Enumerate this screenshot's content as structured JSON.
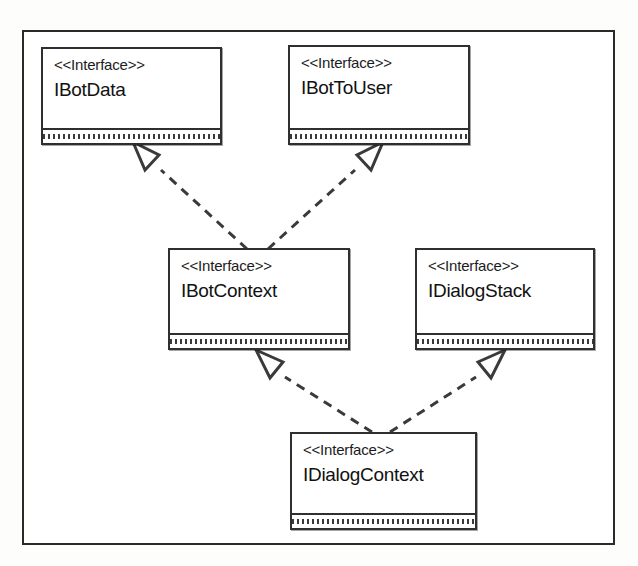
{
  "diagram": {
    "type": "uml-class-diagram",
    "title": "",
    "frame": {
      "border_color": "#2a2a2a",
      "background": "#ffffff"
    },
    "stereotype_label": "<<Interface>>",
    "classes": [
      {
        "id": "ibotdata",
        "stereotype": "<<Interface>>",
        "name": "IBotData",
        "x": 41,
        "y": 47,
        "width": 181,
        "height": 98
      },
      {
        "id": "ibottouser",
        "stereotype": "<<Interface>>",
        "name": "IBotToUser",
        "x": 288,
        "y": 45,
        "width": 182,
        "height": 100
      },
      {
        "id": "ibotcontext",
        "stereotype": "<<Interface>>",
        "name": "IBotContext",
        "x": 168,
        "y": 248,
        "width": 182,
        "height": 102
      },
      {
        "id": "idialogstack",
        "stereotype": "<<Interface>>",
        "name": "IDialogStack",
        "x": 415,
        "y": 248,
        "width": 180,
        "height": 102
      },
      {
        "id": "idialogcontext",
        "stereotype": "<<Interface>>",
        "name": "IDialogContext",
        "x": 290,
        "y": 432,
        "width": 187,
        "height": 98
      }
    ],
    "relationships": [
      {
        "id": "rel-ibotcontext-ibotdata",
        "kind": "realization",
        "line_style": "dashed",
        "arrowhead": "hollow-triangle",
        "from": "IBotContext",
        "to": "IBotData"
      },
      {
        "id": "rel-ibotcontext-ibottouser",
        "kind": "realization",
        "line_style": "dashed",
        "arrowhead": "hollow-triangle",
        "from": "IBotContext",
        "to": "IBotToUser"
      },
      {
        "id": "rel-idialogcontext-ibotcontext",
        "kind": "realization",
        "line_style": "dashed",
        "arrowhead": "hollow-triangle",
        "from": "IDialogContext",
        "to": "IBotContext"
      },
      {
        "id": "rel-idialogcontext-idialogstack",
        "kind": "realization",
        "line_style": "dashed",
        "arrowhead": "hollow-triangle",
        "from": "IDialogContext",
        "to": "IDialogStack"
      }
    ],
    "colors": {
      "line": "#3a3a3a",
      "box_border": "#2f2f2f",
      "text": "#111111",
      "background": "#ffffff"
    }
  }
}
